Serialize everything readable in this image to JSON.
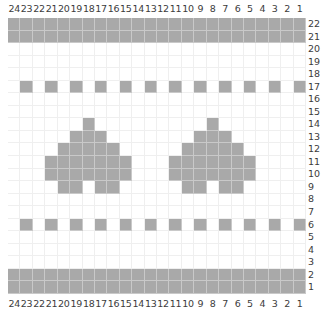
{
  "chart": {
    "title": "",
    "columns": 24,
    "rows": 22,
    "column_labels": [
      "24",
      "23",
      "22",
      "21",
      "20",
      "19",
      "18",
      "17",
      "16",
      "15",
      "14",
      "13",
      "12",
      "11",
      "10",
      "9",
      "8",
      "7",
      "6",
      "5",
      "4",
      "3",
      "2",
      "1"
    ],
    "row_labels": [
      "22",
      "21",
      "20",
      "19",
      "18",
      "17",
      "16",
      "15",
      "14",
      "13",
      "12",
      "11",
      "10",
      "9",
      "8",
      "7",
      "6",
      "5",
      "4",
      "3",
      "2",
      "1"
    ],
    "colors": {
      "filled": "#a9a9a9",
      "empty": "#ffffff",
      "gridline": "#efefef"
    },
    "filled_cells_by_row": {
      "22": [
        1,
        2,
        3,
        4,
        5,
        6,
        7,
        8,
        9,
        10,
        11,
        12,
        13,
        14,
        15,
        16,
        17,
        18,
        19,
        20,
        21,
        22,
        23,
        24
      ],
      "21": [
        1,
        2,
        3,
        4,
        5,
        6,
        7,
        8,
        9,
        10,
        11,
        12,
        13,
        14,
        15,
        16,
        17,
        18,
        19,
        20,
        21,
        22,
        23,
        24
      ],
      "20": [],
      "19": [],
      "18": [],
      "17": [
        1,
        3,
        5,
        7,
        9,
        11,
        13,
        15,
        17,
        19,
        21,
        23
      ],
      "16": [],
      "15": [],
      "14": [
        8,
        18
      ],
      "13": [
        7,
        8,
        9,
        17,
        18,
        19
      ],
      "12": [
        6,
        7,
        8,
        9,
        10,
        16,
        17,
        18,
        19,
        20
      ],
      "11": [
        5,
        6,
        7,
        8,
        9,
        10,
        11,
        15,
        16,
        17,
        18,
        19,
        20,
        21
      ],
      "10": [
        5,
        6,
        7,
        8,
        9,
        10,
        11,
        15,
        16,
        17,
        18,
        19,
        20,
        21
      ],
      "9": [
        6,
        7,
        9,
        10,
        16,
        17,
        19,
        20
      ],
      "8": [],
      "7": [],
      "6": [
        1,
        3,
        5,
        7,
        9,
        11,
        13,
        15,
        17,
        19,
        21,
        23
      ],
      "5": [],
      "4": [],
      "3": [],
      "2": [
        1,
        2,
        3,
        4,
        5,
        6,
        7,
        8,
        9,
        10,
        11,
        12,
        13,
        14,
        15,
        16,
        17,
        18,
        19,
        20,
        21,
        22,
        23,
        24
      ],
      "1": [
        1,
        2,
        3,
        4,
        5,
        6,
        7,
        8,
        9,
        10,
        11,
        12,
        13,
        14,
        15,
        16,
        17,
        18,
        19,
        20,
        21,
        22,
        23,
        24
      ]
    }
  }
}
